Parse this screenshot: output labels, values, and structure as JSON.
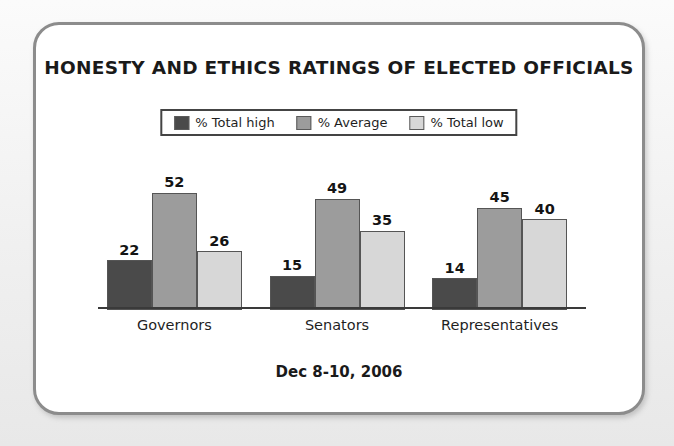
{
  "card": {
    "title": "HONESTY AND ETHICS RATINGS OF ELECTED OFFICIALS",
    "footer_note": "Dec 8-10, 2006"
  },
  "colors": {
    "series_total_high": "#4a4a4a",
    "series_average": "#9c9c9c",
    "series_total_low": "#d7d7d7",
    "bar_outline": "#555555",
    "axis": "#3a3a3a",
    "card_border": "#8c8c8c",
    "card_background": "#ffffff",
    "page_background": "#f2f2f2",
    "text": "#1a1a1a"
  },
  "legend": {
    "items": [
      {
        "label": "% Total high",
        "swatch": "#4a4a4a"
      },
      {
        "label": "% Average",
        "swatch": "#9c9c9c"
      },
      {
        "label": "% Total low",
        "swatch": "#d7d7d7"
      }
    ]
  },
  "chart_data": {
    "type": "bar",
    "title": "HONESTY AND ETHICS RATINGS OF ELECTED OFFICIALS",
    "subtitle": "Dec 8-10, 2006",
    "categories": [
      "Governors",
      "Senators",
      "Representatives"
    ],
    "series": [
      {
        "name": "% Total high",
        "values": [
          22,
          15,
          14
        ],
        "color": "#4a4a4a"
      },
      {
        "name": "% Average",
        "values": [
          52,
          49,
          45
        ],
        "color": "#9c9c9c"
      },
      {
        "name": "% Total low",
        "values": [
          26,
          35,
          40
        ],
        "color": "#d7d7d7"
      }
    ],
    "xlabel": "",
    "ylabel": "",
    "ylim": [
      0,
      52
    ],
    "grid": false,
    "legend_position": "top-center",
    "data_labels": true,
    "axis_ticks": []
  }
}
